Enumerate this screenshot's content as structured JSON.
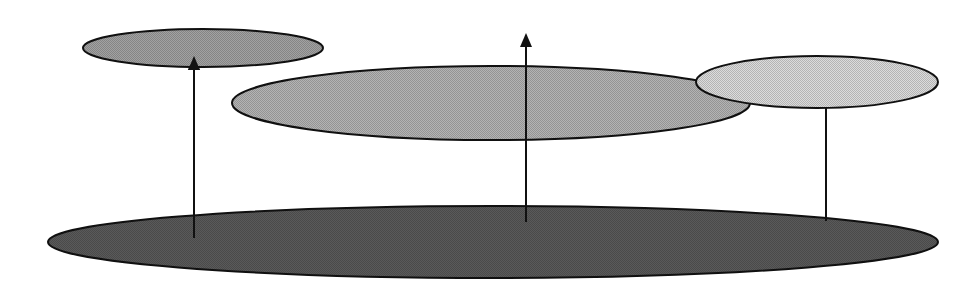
{
  "diagram": {
    "type": "ellipse-layers",
    "canvas": {
      "width": 979,
      "height": 293,
      "background": "#ffffff"
    },
    "stroke_color": "#111111",
    "shapes": [
      {
        "id": "base-ellipse",
        "cx": 493,
        "cy": 242,
        "rx": 445,
        "ry": 36,
        "fill": "#5a5a5a"
      },
      {
        "id": "middle-ellipse",
        "cx": 491,
        "cy": 103,
        "rx": 259,
        "ry": 37,
        "fill": "#b4b4b4"
      },
      {
        "id": "top-left-ellipse",
        "cx": 203,
        "cy": 48,
        "rx": 120,
        "ry": 19,
        "fill": "#a2a2a2"
      },
      {
        "id": "right-ellipse",
        "cx": 817,
        "cy": 82,
        "rx": 121,
        "ry": 26,
        "fill": "#dcdcdc"
      }
    ],
    "connectors": [
      {
        "id": "arrow-left",
        "x": 194,
        "y_from": 238,
        "y_to": 56,
        "arrowhead": true
      },
      {
        "id": "arrow-center",
        "x": 526,
        "y_from": 222,
        "y_to": 33,
        "arrowhead": true
      },
      {
        "id": "line-right",
        "x": 826,
        "y_from": 108,
        "y_to": 221,
        "arrowhead": false
      }
    ]
  }
}
